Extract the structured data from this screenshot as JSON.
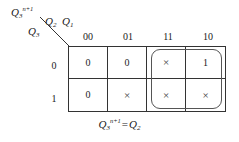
{
  "figure": {
    "type": "karnaugh-map",
    "title_expression": {
      "lhs_base": "Q",
      "lhs_sub": "3",
      "lhs_sup": "n+1",
      "equals": "=",
      "rhs_base": "Q",
      "rhs_sub": "2"
    },
    "corner": {
      "next_state_label": {
        "base": "Q",
        "sub": "3",
        "sup": "n+1"
      },
      "column_var_1": {
        "base": "Q",
        "sub": "2"
      },
      "column_var_2": {
        "base": "Q",
        "sub": "1"
      },
      "row_var": {
        "base": "Q",
        "sub": "3"
      }
    },
    "column_headers": [
      "00",
      "01",
      "11",
      "10"
    ],
    "row_headers": [
      "0",
      "1"
    ],
    "cells": [
      [
        "0",
        "×",
        "1",
        "0"
      ],
      [
        "0",
        "×",
        "×",
        "×"
      ]
    ],
    "grid": {
      "rows": [
        {
          "header": "0",
          "values": [
            "0",
            "0",
            "×",
            "1"
          ]
        },
        {
          "header": "1",
          "values": [
            "0",
            "×",
            "×",
            "×"
          ]
        }
      ]
    },
    "groups": [
      {
        "name": "prime-implicant-group",
        "columns": [
          "11",
          "10"
        ],
        "rows": [
          "0",
          "1"
        ],
        "covered_values": [
          "×",
          "1",
          "×",
          "×"
        ]
      }
    ],
    "colors": {
      "grid_line": "#333333",
      "group_outline": "#555555",
      "text": "#1a1a1a",
      "background": "#ffffff"
    }
  }
}
